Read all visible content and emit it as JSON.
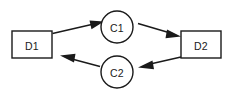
{
  "diagram": {
    "type": "cycle-flow-diagram",
    "background_color": "#ffffff",
    "stroke_color": "#1a1a1a",
    "nodes": [
      {
        "id": "D1",
        "label": "D1",
        "shape": "rectangle",
        "x": 12,
        "y": 31,
        "width": 40,
        "height": 27
      },
      {
        "id": "C1",
        "label": "C1",
        "shape": "circle",
        "cx": 117,
        "cy": 27,
        "r": 16
      },
      {
        "id": "D2",
        "label": "D2",
        "shape": "rectangle",
        "x": 181,
        "y": 31,
        "width": 40,
        "height": 27
      },
      {
        "id": "C2",
        "label": "C2",
        "shape": "circle",
        "cx": 117,
        "cy": 72,
        "r": 16
      }
    ],
    "edges": [
      {
        "id": "d1-to-c1",
        "from": "D1",
        "to": "C1",
        "direction": "forward",
        "arrowhead": "filled-triangle"
      },
      {
        "id": "c1-to-d2",
        "from": "C1",
        "to": "D2",
        "direction": "forward",
        "arrowhead": "filled-triangle"
      },
      {
        "id": "d2-to-c2",
        "from": "D2",
        "to": "C2",
        "direction": "forward",
        "arrowhead": "filled-triangle"
      },
      {
        "id": "c2-to-d1",
        "from": "C2",
        "to": "D1",
        "direction": "forward",
        "arrowhead": "filled-triangle"
      }
    ]
  }
}
